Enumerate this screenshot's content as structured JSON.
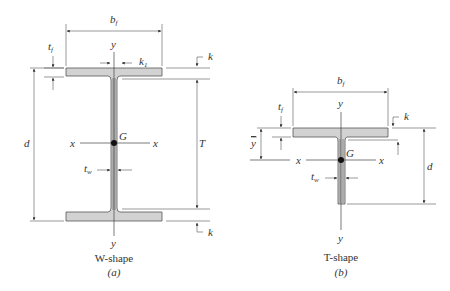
{
  "figure": {
    "w_shape": {
      "caption": "W-shape",
      "sublabel": "(a)",
      "labels": {
        "bf": "b",
        "bf_sub": "f",
        "tf": "t",
        "tf_sub": "f",
        "y_top": "y",
        "y_bottom": "y",
        "k1": "k",
        "k1_sub": "1",
        "k_top": "k",
        "k_bottom": "k",
        "d": "d",
        "T": "T",
        "x_left": "x",
        "x_right": "x",
        "G": "G",
        "tw": "t",
        "tw_sub": "w"
      }
    },
    "t_shape": {
      "caption": "T-shape",
      "sublabel": "(b)",
      "labels": {
        "bf": "b",
        "bf_sub": "f",
        "tf": "t",
        "tf_sub": "f",
        "y_top": "y",
        "y_bottom": "y",
        "ybar": "y",
        "k": "k",
        "d": "d",
        "x_left": "x",
        "x_right": "x",
        "G": "G",
        "tw": "t",
        "tw_sub": "w"
      }
    },
    "colors": {
      "steel_fill": "#d2d2d2",
      "line": "#555555",
      "centroid": "#111111"
    }
  }
}
